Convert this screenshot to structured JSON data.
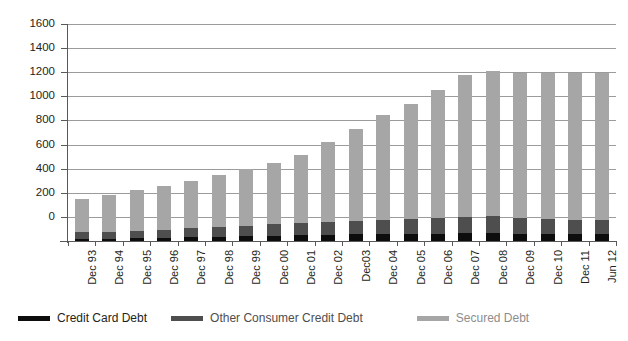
{
  "chart_data": {
    "type": "bar",
    "subtype": "stacked-bar",
    "title": "",
    "subtitle": "",
    "xlabel": "",
    "ylabel": "",
    "grid": true,
    "legend_position": "bottom",
    "ylim": [
      -200,
      1600
    ],
    "yticks": [
      1600,
      1400,
      1200,
      1000,
      800,
      600,
      400,
      200,
      0
    ],
    "ytick_labels": [
      "1600",
      "1400",
      "1200",
      "1000",
      "800",
      "600",
      "400",
      "200",
      "0"
    ],
    "categories": [
      "Dec 93",
      "Dec 94",
      "Dec 95",
      "Dec 96",
      "Dec 97",
      "Dec 98",
      "Dec 99",
      "Dec 00",
      "Dec 01",
      "Dec 02",
      "Dec03",
      "Dec 04",
      "Dec 05",
      "Dec 06",
      "Dec 07",
      "Dec 08",
      "Dec 09",
      "Dec 10",
      "Dec 11",
      "Jun 12"
    ],
    "series": [
      {
        "name": "Credit Card Debt",
        "color": "#0d0d0d",
        "values": [
          18,
          20,
          24,
          28,
          32,
          36,
          40,
          44,
          48,
          52,
          56,
          58,
          60,
          62,
          64,
          64,
          60,
          58,
          56,
          55
        ]
      },
      {
        "name": "Other Consumer Credit Debt",
        "color": "#4e4e4e",
        "values": [
          55,
          58,
          62,
          66,
          72,
          80,
          88,
          94,
          100,
          106,
          112,
          118,
          124,
          130,
          138,
          140,
          132,
          126,
          120,
          118
        ]
      },
      {
        "name": "Secured Debt",
        "color": "#a6a6a6",
        "values": [
          277,
          302,
          334,
          366,
          396,
          434,
          472,
          512,
          562,
          662,
          762,
          872,
          956,
          1058,
          1178,
          1206,
          1198,
          1206,
          1214,
          1217
        ]
      }
    ],
    "totals": [
      350,
      380,
      420,
      460,
      500,
      550,
      600,
      650,
      710,
      820,
      930,
      1048,
      1140,
      1250,
      1380,
      1410,
      1390,
      1390,
      1390,
      1390
    ]
  },
  "legend": {
    "items": [
      {
        "label": "Credit Card Debt",
        "color": "#0d0d0d"
      },
      {
        "label": "Other Consumer Credit Debt",
        "color": "#4e4e4e"
      },
      {
        "label": "Secured Debt",
        "color": "#a6a6a6"
      }
    ]
  },
  "colors": {
    "axis": "#58595b",
    "grid": "#9b9b9b",
    "text": "#231f20",
    "background": "#ffffff"
  }
}
